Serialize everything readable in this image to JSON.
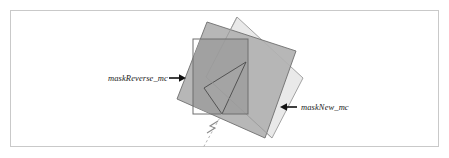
{
  "figure": {
    "name": "mask-overlap-diagram",
    "background_color": "#ffffff",
    "frame_border_color": "#c9c9c9",
    "width": 449,
    "height": 158
  },
  "labels": {
    "mask_reverse": "maskReverse_mc",
    "mask_new": "maskNew_mc"
  },
  "shapes": {
    "dark_square": {
      "name": "maskReverse_mc",
      "fill": "#b1b1b1",
      "stroke": "#6e6e6e",
      "points": "207,22 296,51 265,138 177,99"
    },
    "light_square": {
      "name": "maskNew_mc",
      "fill": "#e9e9e9",
      "stroke": "#9a9a9a",
      "points": "237,17 303,78 272,138 206,77"
    },
    "outline_rectangle": {
      "name": "mask-bounds-rectangle",
      "fill": "none",
      "stroke": "#6e6e6e",
      "x": 193,
      "y": 39,
      "width": 55,
      "height": 75
    },
    "fold_triangle": {
      "name": "fold-triangle",
      "fill": "#a5a5a5",
      "stroke": "#4a4a4a",
      "points": "246,62 204,88 222,114"
    },
    "overlap_dark": {
      "name": "overlap-region",
      "fill": "#9d9d9d"
    },
    "dashed_line": {
      "name": "registration-dashed-line",
      "stroke": "#b5b5b5",
      "x1": 222,
      "y1": 114,
      "x2": 203,
      "y2": 148
    },
    "break_mark": {
      "name": "line-break-mark",
      "stroke": "#8c8c8c"
    }
  },
  "arrows": {
    "left_arrow": {
      "name": "arrow-to-mask-reverse",
      "direction": "right",
      "tip_x": 186,
      "tip_y": 78,
      "tail_x": 170,
      "tail_y": 78,
      "color": "#111111"
    },
    "right_arrow": {
      "name": "arrow-to-mask-new",
      "direction": "left",
      "tip_x": 280,
      "tip_y": 107,
      "tail_x": 296,
      "tail_y": 107,
      "color": "#111111"
    }
  }
}
